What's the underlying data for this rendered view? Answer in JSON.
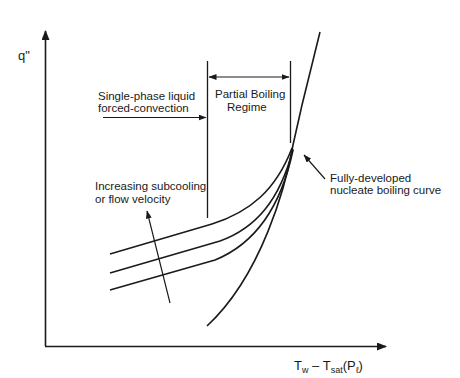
{
  "diagram": {
    "type": "boiling-curve",
    "y_axis_label": "q\"",
    "x_axis_label": {
      "main_T": "T",
      "sub_w": "w",
      "minus": " – T",
      "sub_sat": "sat",
      "paren_open": "(P",
      "sub_l": "ℓ",
      "paren_close": ")"
    },
    "annotations": {
      "single_phase_line1": "Single-phase liquid",
      "single_phase_line2": "forced-convection",
      "partial_boiling_line1": "Partial Boiling",
      "partial_boiling_line2": "Regime",
      "fully_developed_line1": "Fully-developed",
      "fully_developed_line2": "nucleate boiling curve",
      "subcooling_line1": "Increasing subcooling",
      "subcooling_line2": "or flow velocity"
    },
    "curves": [
      {
        "name": "fully-developed-nucleate-boiling"
      },
      {
        "name": "forced-convection-curve-1"
      },
      {
        "name": "forced-convection-curve-2"
      },
      {
        "name": "forced-convection-curve-3"
      }
    ],
    "colors": {
      "ink": "#1a1a1a",
      "background": "#ffffff"
    }
  }
}
